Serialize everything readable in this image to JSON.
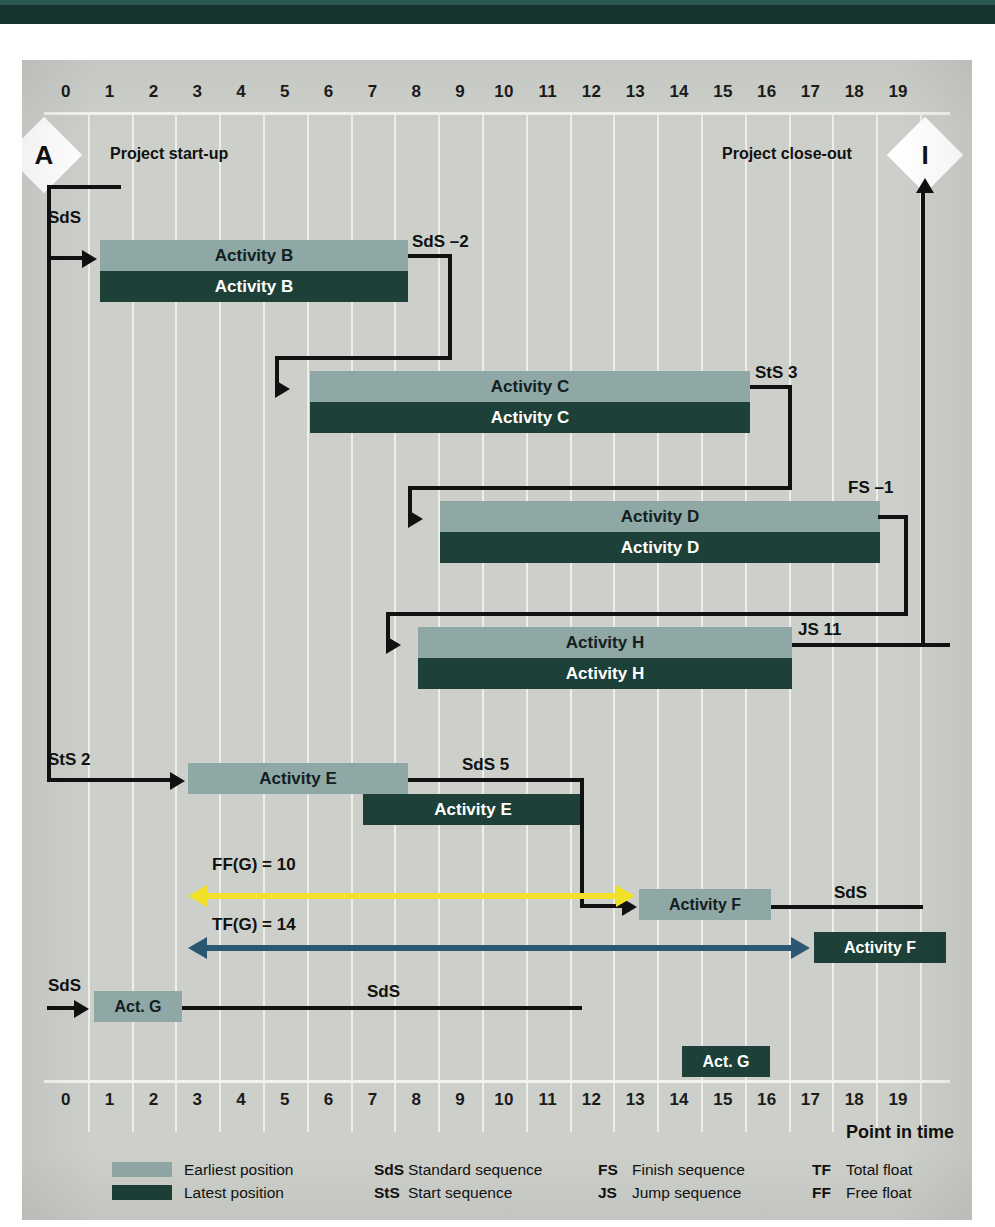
{
  "chart_data": {
    "type": "bar",
    "xlabel": "Point in time",
    "ylabel": "",
    "xlim": [
      0,
      20
    ],
    "grid": true,
    "tick_labels": [
      "0",
      "1",
      "2",
      "3",
      "4",
      "5",
      "6",
      "7",
      "8",
      "9",
      "10",
      "11",
      "12",
      "13",
      "14",
      "15",
      "16",
      "17",
      "18",
      "19"
    ],
    "tick_values": [
      0,
      1,
      2,
      3,
      4,
      5,
      6,
      7,
      8,
      9,
      10,
      11,
      12,
      13,
      14,
      15,
      16,
      17,
      18,
      19
    ],
    "legend_position": "bottom",
    "series": [
      {
        "name": "Earliest position",
        "color": "#8fa7a5"
      },
      {
        "name": "Latest position",
        "color": "#1d4038"
      }
    ],
    "activities": [
      {
        "label": "Activity B",
        "earliest_start": 1,
        "earliest_finish": 8,
        "latest_start": 1,
        "latest_finish": 8
      },
      {
        "label": "Activity C",
        "earliest_start": 6,
        "earliest_finish": 16,
        "latest_start": 6,
        "latest_finish": 16
      },
      {
        "label": "Activity D",
        "earliest_start": 9,
        "earliest_finish": 19,
        "latest_start": 9,
        "latest_finish": 19
      },
      {
        "label": "Activity H",
        "earliest_start": 9,
        "earliest_finish": 17.5,
        "latest_start": 9,
        "latest_finish": 17.5
      },
      {
        "label": "Activity E",
        "earliest_start": 3,
        "earliest_finish": 8,
        "latest_start": 7,
        "latest_finish": 12
      },
      {
        "label": "Activity F",
        "earliest_start": 13,
        "earliest_finish": 16,
        "latest_start": 17,
        "latest_finish": 20
      },
      {
        "label": "Act. G",
        "earliest_start": 1,
        "earliest_finish": 3,
        "latest_start": 15,
        "latest_finish": 17
      }
    ],
    "annotations": [
      {
        "text": "FF(G) = 10",
        "value": 10,
        "from": 2,
        "to": 12,
        "color": "#f2e029"
      },
      {
        "text": "TF(G) = 14",
        "value": 14,
        "from": 2,
        "to": 16,
        "color": "#2c5773"
      }
    ]
  },
  "nodes": {
    "start": {
      "letter": "A",
      "caption": "Project start-up"
    },
    "end": {
      "letter": "I",
      "caption": "Project close-out"
    }
  },
  "relations": {
    "a_to_b": "SdS",
    "b_to_c": "SdS –2",
    "c_to_d": "StS 3",
    "d_to_h": "FS –1",
    "h_to_i": "JS 11",
    "a_to_e": "StS 2",
    "e_to_f": "SdS 5",
    "a_to_g": "SdS",
    "g_to_f": "SdS",
    "f_to_i": "SdS"
  },
  "axis": {
    "caption": "Point in time"
  },
  "legend": {
    "rows": [
      {
        "swatch": "earliest",
        "text": "Earliest position",
        "abbr1": "SdS",
        "def1": "Standard sequence",
        "abbr2": "FS",
        "def2": "Finish sequence",
        "abbr3": "TF",
        "def3": "Total float"
      },
      {
        "swatch": "latest",
        "text": "Latest position",
        "abbr1": "StS",
        "def1": "Start sequence",
        "abbr2": "JS",
        "def2": "Jump sequence",
        "abbr3": "FF",
        "def3": "Free float"
      }
    ]
  },
  "colors": {
    "earliest": "#8fa7a5",
    "latest": "#1d4038",
    "free_float": "#f2e029",
    "total_float": "#2c5773",
    "plate": "#cdd0ca",
    "band": "#17342f"
  }
}
